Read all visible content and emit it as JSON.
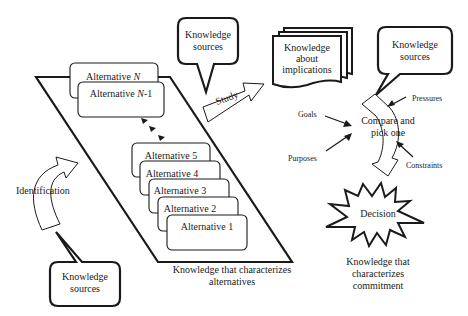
{
  "diagram": {
    "colors": {
      "stroke": "#1a1a1a",
      "fill": "#ffffff",
      "background": "#ffffff"
    },
    "alternatives": [
      {
        "label": "Alternative N",
        "prefix": "Alternative ",
        "suffix_italic": "N",
        "tail": ""
      },
      {
        "label": "Alternative N-1",
        "prefix": "Alternative ",
        "suffix_italic": "N",
        "tail": "-1"
      },
      {
        "label": "Alternative 5"
      },
      {
        "label": "Alternative 4"
      },
      {
        "label": "Alternative 3"
      },
      {
        "label": "Alternative 2"
      },
      {
        "label": "Alternative 1"
      }
    ],
    "alternatives_caption": [
      "Knowledge that characterizes",
      "alternatives"
    ],
    "knowledge_sources_top": [
      "Knowledge",
      "sources"
    ],
    "knowledge_sources_bottom": [
      "Knowledge",
      "sources"
    ],
    "knowledge_sources_right": [
      "Knowledge",
      "sources"
    ],
    "knowledge_implications": [
      "Knowledge",
      "about",
      "implications"
    ],
    "identification_label": "Identification",
    "study_label": "Study",
    "compare_label": [
      "Compare and",
      "pick one"
    ],
    "inputs": {
      "goals": "Goals",
      "purposes": "Purposes",
      "pressures": "Pressures",
      "constraints": "Constraints"
    },
    "decision_label": "Decision",
    "commitment_caption": [
      "Knowledge that",
      "characterizes",
      "commitment"
    ]
  }
}
